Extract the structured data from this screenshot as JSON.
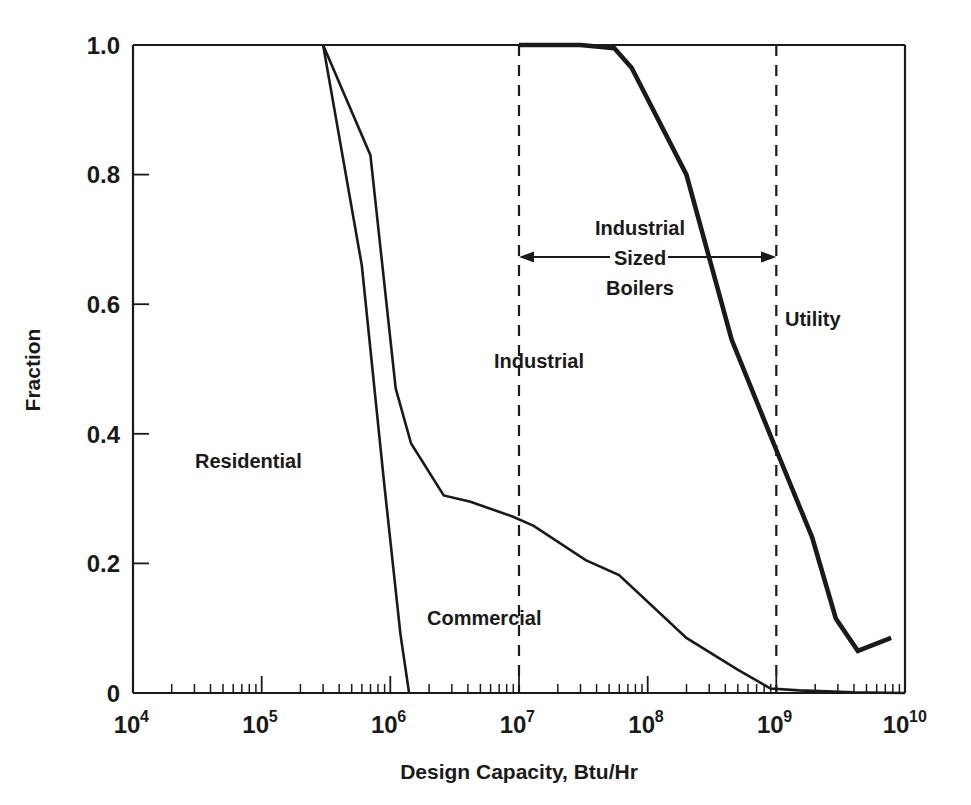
{
  "figure": {
    "xlabel": "Design Capacity, Btu/Hr",
    "ylabel": "Fraction"
  },
  "axes": {
    "y_ticks": [
      "0",
      "0.2",
      "0.4",
      "0.6",
      "0.8",
      "1.0"
    ],
    "x_ticks": [
      {
        "mantissa": "10",
        "exponent": "4"
      },
      {
        "mantissa": "10",
        "exponent": "5"
      },
      {
        "mantissa": "10",
        "exponent": "6"
      },
      {
        "mantissa": "10",
        "exponent": "7"
      },
      {
        "mantissa": "10",
        "exponent": "8"
      },
      {
        "mantissa": "10",
        "exponent": "9"
      },
      {
        "mantissa": "10",
        "exponent": "10"
      }
    ]
  },
  "annotations": {
    "residential": "Residential",
    "commercial": "Commercial",
    "industrial": "Industrial",
    "utility": "Utility",
    "sized_boilers_line1": "Industrial",
    "sized_boilers_line2": "Sized",
    "sized_boilers_line3": "Boilers"
  },
  "chart_data": {
    "type": "line",
    "title": "",
    "xlabel": "Design Capacity, Btu/Hr",
    "ylabel": "Fraction",
    "xscale": "log",
    "xlim": [
      10000,
      10000000000
    ],
    "ylim": [
      0,
      1.0
    ],
    "grid": false,
    "legend": "none (inline text labels)",
    "x_tick_values": [
      10000,
      100000,
      1000000,
      10000000,
      100000000,
      1000000000,
      10000000000
    ],
    "y_tick_values": [
      0,
      0.2,
      0.4,
      0.6,
      0.8,
      1.0
    ],
    "annotations": [
      {
        "text": "Residential",
        "x": 300000,
        "y": 0.44
      },
      {
        "text": "Commercial",
        "x": 6000000,
        "y": 0.125
      },
      {
        "text": "Industrial",
        "x": 8500000,
        "y": 0.525
      },
      {
        "text": "Utility",
        "x": 1700000000,
        "y": 0.58
      },
      {
        "text": "Industrial Sized Boilers",
        "x": 90000000,
        "y": 0.7
      }
    ],
    "reference_lines": [
      {
        "x": 10000000,
        "style": "dashed",
        "label": "Industrial boundary"
      },
      {
        "x": 1000000000,
        "style": "dashed",
        "label": "Utility boundary"
      }
    ],
    "span_arrow": {
      "from": 10000000,
      "to": 1000000000,
      "y": 0.655,
      "label": "Industrial Sized Boilers"
    },
    "series": [
      {
        "name": "Residential",
        "linewidth": "thin",
        "points": [
          [
            300000,
            1.0
          ],
          [
            600000,
            0.66
          ],
          [
            900000,
            0.32
          ],
          [
            1200000,
            0.09
          ],
          [
            1400000,
            0.0
          ]
        ]
      },
      {
        "name": "Commercial",
        "linewidth": "thin",
        "points": [
          [
            300000,
            1.0
          ],
          [
            700000,
            0.83
          ],
          [
            1100000,
            0.47
          ],
          [
            1450000,
            0.385
          ],
          [
            2600000,
            0.305
          ],
          [
            4200000,
            0.295
          ],
          [
            9000000,
            0.272
          ],
          [
            13000000,
            0.258
          ],
          [
            33000000,
            0.205
          ],
          [
            60000000,
            0.182
          ],
          [
            200000000,
            0.085
          ],
          [
            500000000,
            0.036
          ],
          [
            900000000,
            0.007
          ],
          [
            1500000000,
            0.004
          ],
          [
            4000000000,
            0.001
          ],
          [
            10000000000,
            0.0
          ]
        ]
      },
      {
        "name": "Utility",
        "linewidth": "thick",
        "points": [
          [
            10000000,
            1.0
          ],
          [
            30000000,
            1.0
          ],
          [
            55000000,
            0.995
          ],
          [
            75000000,
            0.965
          ],
          [
            200000000,
            0.8
          ],
          [
            450000000,
            0.545
          ],
          [
            1000000000,
            0.375
          ],
          [
            1900000000,
            0.24
          ],
          [
            2900000000,
            0.115
          ],
          [
            4300000000,
            0.065
          ],
          [
            7800000000,
            0.085
          ]
        ]
      }
    ]
  }
}
